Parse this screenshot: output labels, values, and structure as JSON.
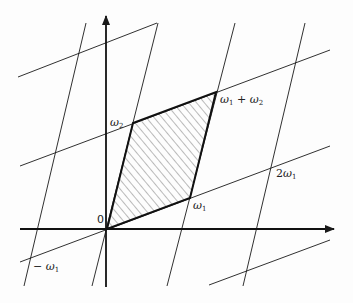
{
  "diagram": {
    "colors": {
      "line": "#1a1a1a",
      "hatch": "#555555",
      "background": "#fdfdfd"
    },
    "labels": {
      "origin": "0",
      "omega1": {
        "sym": "ω",
        "sub": "1"
      },
      "omega2": {
        "sym": "ω",
        "sub": "2"
      },
      "omega1_plus_omega2": {
        "sym1": "ω",
        "sub1": "1",
        "plus": " + ",
        "sym2": "ω",
        "sub2": "2"
      },
      "two_omega1": {
        "coef": "2",
        "sym": "ω",
        "sub": "1"
      },
      "minus_omega1": {
        "minus": "− ",
        "sym": "ω",
        "sub": "1"
      }
    },
    "points": {
      "origin": [
        107,
        229
      ],
      "omega1": [
        190,
        198
      ],
      "omega2": [
        133,
        123
      ],
      "omega1_plus_omega2": [
        216,
        92
      ],
      "two_omega1": [
        273,
        167
      ],
      "minus_omega1": [
        24,
        260
      ]
    }
  }
}
